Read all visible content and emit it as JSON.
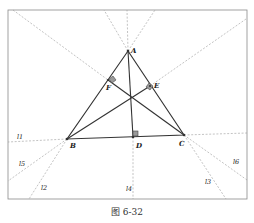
{
  "figure": {
    "caption": "图 6-32",
    "points": {
      "A": {
        "label": "A",
        "x": 128,
        "y": 51
      },
      "B": {
        "label": "B",
        "x": 67,
        "y": 139
      },
      "C": {
        "label": "C",
        "x": 184,
        "y": 135
      },
      "D": {
        "label": "D",
        "x": 133,
        "y": 137
      },
      "E": {
        "label": "E",
        "x": 150,
        "y": 86
      },
      "F": {
        "label": "F",
        "x": 108,
        "y": 80
      },
      "H": {
        "label": "",
        "x": 131,
        "y": 97
      }
    },
    "lines": {
      "l1": "l1",
      "l2": "l2",
      "l3": "l3",
      "l4": "l4",
      "l5": "l5",
      "l6": "l6"
    },
    "colors": {
      "solid": "#333333",
      "dashed": "#9a9a9a",
      "frame": "#8a8a8a"
    }
  }
}
